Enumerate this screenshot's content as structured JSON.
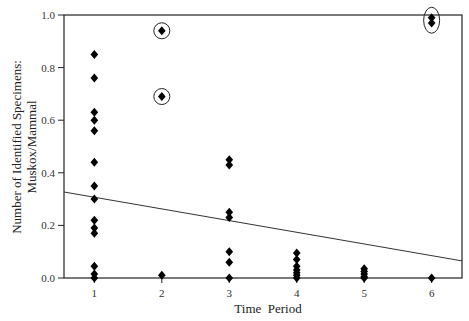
{
  "chart_data": {
    "type": "scatter",
    "title": "",
    "xlabel": "Time  Period",
    "ylabel_line1": "Number of Identified Specimens:",
    "ylabel_line2": "Muskox/Mammal",
    "xlim": [
      0.55,
      6.45
    ],
    "ylim": [
      0.0,
      1.0
    ],
    "x_ticks": [
      "1",
      "2",
      "3",
      "4",
      "5",
      "6"
    ],
    "y_ticks": [
      "0.0",
      "0.2",
      "0.4",
      "0.6",
      "0.8",
      "1.0"
    ],
    "grid": false,
    "legend": "none",
    "series": [
      {
        "name": "specimens",
        "marker": "diamond",
        "points": [
          [
            1,
            0.85
          ],
          [
            1,
            0.76
          ],
          [
            1,
            0.63
          ],
          [
            1,
            0.6
          ],
          [
            1,
            0.56
          ],
          [
            1,
            0.44
          ],
          [
            1,
            0.35
          ],
          [
            1,
            0.3
          ],
          [
            1,
            0.22
          ],
          [
            1,
            0.19
          ],
          [
            1,
            0.17
          ],
          [
            1,
            0.045
          ],
          [
            1,
            0.015
          ],
          [
            1,
            0.0
          ],
          [
            2,
            0.94
          ],
          [
            2,
            0.69
          ],
          [
            2,
            0.01
          ],
          [
            3,
            0.45
          ],
          [
            3,
            0.43
          ],
          [
            3,
            0.25
          ],
          [
            3,
            0.23
          ],
          [
            3,
            0.1
          ],
          [
            3,
            0.06
          ],
          [
            3,
            0.0
          ],
          [
            4,
            0.095
          ],
          [
            4,
            0.07
          ],
          [
            4,
            0.045
          ],
          [
            4,
            0.03
          ],
          [
            4,
            0.02
          ],
          [
            4,
            0.01
          ],
          [
            4,
            0.0
          ],
          [
            5,
            0.035
          ],
          [
            5,
            0.025
          ],
          [
            5,
            0.015
          ],
          [
            5,
            0.005
          ],
          [
            5,
            0.0
          ],
          [
            6,
            0.99
          ],
          [
            6,
            0.97
          ],
          [
            6,
            0.0
          ]
        ]
      }
    ],
    "circled_points": [
      {
        "x": 2,
        "y": 0.94,
        "shape": "circle"
      },
      {
        "x": 2,
        "y": 0.69,
        "shape": "circle"
      },
      {
        "x": 6,
        "y": 0.98,
        "shape": "ellipse"
      }
    ],
    "trendline": {
      "x0": 0.55,
      "y0": 0.327,
      "x1": 6.45,
      "y1": 0.065
    }
  }
}
